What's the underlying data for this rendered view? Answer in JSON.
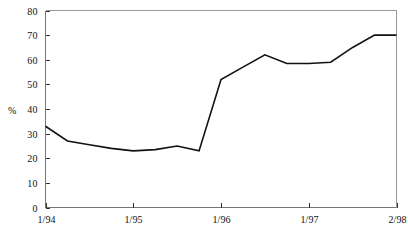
{
  "chart_data": {
    "type": "line",
    "title": "",
    "xlabel": "",
    "ylabel": "%",
    "ylim": [
      0,
      80
    ],
    "ytick_values": [
      0,
      10,
      20,
      30,
      40,
      50,
      60,
      70,
      80
    ],
    "ytick_labels": [
      "0",
      "10",
      "20",
      "30",
      "40",
      "50",
      "60",
      "70",
      "80"
    ],
    "xtick_labels": [
      "1/94",
      "1/95",
      "1/96",
      "1/97",
      "2/98"
    ],
    "xtick_positions": [
      0,
      4,
      8,
      12,
      16
    ],
    "grid": false,
    "legend": null,
    "x": [
      0,
      1,
      2,
      3,
      4,
      5,
      6,
      7,
      8,
      9,
      10,
      11,
      12,
      13,
      14,
      15,
      16
    ],
    "series": [
      {
        "name": "percent",
        "values": [
          33,
          27,
          25.5,
          24,
          23,
          23.5,
          25,
          23,
          52,
          57,
          62,
          58.5,
          58.5,
          59,
          65,
          70,
          70
        ],
        "color": "#111111",
        "line_width": 1.6
      }
    ]
  },
  "axes": {
    "y_axis_title": "%",
    "frame_color": "#6b6b6b",
    "tick_color": "#333333",
    "background": "#ffffff"
  }
}
